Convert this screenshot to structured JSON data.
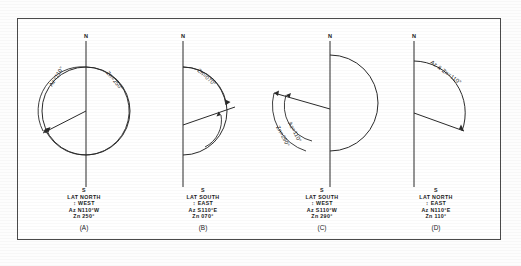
{
  "figure": {
    "panels": [
      {
        "letter": "(A)",
        "arc_labels": [
          {
            "name": "azimuth-arc-label",
            "text": "Az=110°"
          },
          {
            "name": "zenith-arc-label",
            "text": "Zn=250°"
          }
        ],
        "north_label": "N",
        "south_label": "S",
        "caption": [
          "LAT NORTH",
          "↕ WEST",
          "Az N110°W",
          "Zn 250°"
        ]
      },
      {
        "letter": "(B)",
        "arc_labels": [
          {
            "name": "zenith-arc-label",
            "text": "Zn=070°"
          }
        ],
        "north_label": "N",
        "south_label": "S",
        "caption": [
          "LAT SOUTH",
          "↕ EAST",
          "Az S110°E",
          "Zn 070°"
        ]
      },
      {
        "letter": "(C)",
        "arc_labels": [
          {
            "name": "azimuth-arc-label",
            "text": "Az=110°"
          },
          {
            "name": "zenith-arc-label",
            "text": "Zn=290°"
          }
        ],
        "north_label": "N",
        "south_label": "S",
        "caption": [
          "LAT SOUTH",
          "↕ WEST",
          "Az S110°W",
          "Zn 290°"
        ]
      },
      {
        "letter": "(D)",
        "arc_labels": [
          {
            "name": "azimuth-zenith-arc-label",
            "text": "Az & Zn=110°"
          }
        ],
        "north_label": "N",
        "south_label": "S",
        "caption": [
          "LAT NORTH",
          "↕ EAST",
          "Az N110°E",
          "Zn 110°"
        ]
      }
    ],
    "colors": {
      "ink": "#1a1a1a",
      "line": "#2a2a2a",
      "frame": "#4a4a4a",
      "paper": "#ffffff"
    }
  }
}
